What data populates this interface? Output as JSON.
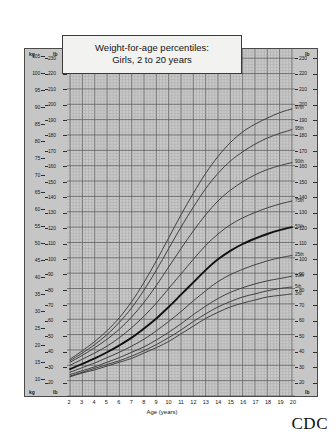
{
  "title": {
    "line1": "Weight-for-age percentiles:",
    "line2": "Girls, 2 to 20 years"
  },
  "branding": {
    "logo_text": "CDC"
  },
  "axes": {
    "x": {
      "label": "Age (years)",
      "ticks": [
        2,
        3,
        4,
        5,
        6,
        7,
        8,
        9,
        10,
        11,
        12,
        13,
        14,
        15,
        16,
        17,
        18,
        19,
        20
      ],
      "min": 1.75,
      "max": 20.25,
      "minor_step": 0.25
    },
    "y_kg": {
      "unit": "kg",
      "ticks": [
        10,
        15,
        20,
        25,
        30,
        35,
        40,
        45,
        50,
        55,
        60,
        65,
        70,
        75,
        80,
        85,
        90,
        95,
        100,
        105
      ],
      "min": 4.5,
      "max": 107.0
    },
    "y_lb_left": {
      "unit": "lb",
      "ticks": [
        10,
        20,
        30,
        40,
        50,
        60,
        70,
        80,
        90,
        100,
        110,
        120,
        130,
        140,
        150,
        160,
        170,
        180,
        190,
        200,
        210,
        220,
        230
      ],
      "min": 10,
      "max": 236
    },
    "y_lb_right": {
      "unit": "lb",
      "ticks": [
        10,
        20,
        30,
        40,
        50,
        60,
        70,
        80,
        90,
        100,
        110,
        120,
        130,
        140,
        150,
        160,
        170,
        180,
        190,
        200,
        210,
        220,
        230
      ]
    }
  },
  "chart_data": {
    "type": "line",
    "title": "Weight-for-age percentiles: Girls, 2 to 20 years",
    "xlabel": "Age (years)",
    "ylabel": "Weight (lb / kg)",
    "xlim": [
      1.75,
      20.25
    ],
    "ylim": [
      10,
      236
    ],
    "ylim_kg": [
      4.5,
      107
    ],
    "grid": true,
    "legend": "right-of-curves",
    "x": [
      2,
      3,
      4,
      5,
      6,
      7,
      8,
      9,
      10,
      11,
      12,
      13,
      14,
      15,
      16,
      17,
      18,
      19,
      20
    ],
    "series": [
      {
        "name": "97th",
        "label": "97th",
        "unit": "lb",
        "bold": false,
        "values": [
          34.0,
          39.5,
          45.5,
          52.5,
          61.0,
          71.5,
          84.0,
          98.0,
          113.0,
          128.0,
          142.0,
          155.0,
          166.0,
          175.0,
          182.0,
          187.0,
          191.0,
          194.5,
          197.0
        ]
      },
      {
        "name": "95th",
        "label": "95th",
        "unit": "lb",
        "bold": false,
        "values": [
          33.0,
          38.0,
          43.5,
          50.0,
          58.0,
          67.5,
          79.0,
          92.0,
          106.0,
          120.0,
          133.0,
          145.0,
          155.0,
          163.0,
          169.0,
          174.0,
          178.0,
          181.0,
          183.5
        ]
      },
      {
        "name": "90th",
        "label": "90th",
        "unit": "lb",
        "bold": false,
        "values": [
          32.0,
          36.5,
          41.5,
          47.0,
          53.5,
          61.5,
          71.0,
          82.0,
          94.0,
          106.0,
          117.5,
          128.0,
          137.0,
          144.0,
          149.5,
          154.0,
          157.5,
          160.0,
          162.0
        ]
      },
      {
        "name": "75th",
        "label": "75th",
        "unit": "lb",
        "bold": false,
        "values": [
          30.0,
          34.0,
          38.0,
          42.5,
          48.0,
          54.5,
          62.0,
          70.5,
          80.0,
          89.5,
          99.0,
          108.0,
          115.5,
          121.5,
          126.0,
          129.5,
          132.5,
          135.0,
          137.0
        ]
      },
      {
        "name": "50th",
        "label": "50th",
        "unit": "lb",
        "bold": true,
        "values": [
          27.5,
          31.0,
          34.5,
          38.5,
          43.0,
          48.0,
          54.0,
          60.5,
          68.0,
          76.0,
          84.0,
          92.0,
          99.0,
          104.5,
          109.0,
          112.5,
          115.5,
          118.0,
          120.0
        ]
      },
      {
        "name": "25th",
        "label": "25th",
        "unit": "lb",
        "bold": false,
        "values": [
          25.5,
          28.5,
          31.5,
          35.0,
          38.5,
          42.5,
          47.0,
          52.5,
          58.5,
          65.0,
          72.0,
          78.5,
          84.5,
          89.0,
          92.5,
          95.5,
          98.0,
          100.0,
          101.5
        ]
      },
      {
        "name": "10th",
        "label": "10th",
        "unit": "lb",
        "bold": false,
        "values": [
          24.0,
          26.5,
          29.0,
          32.0,
          35.0,
          38.5,
          42.0,
          46.5,
          51.5,
          57.0,
          63.0,
          68.5,
          73.5,
          77.5,
          80.5,
          83.0,
          85.0,
          86.5,
          88.0
        ]
      },
      {
        "name": "5th",
        "label": "5th",
        "unit": "lb",
        "bold": false,
        "values": [
          23.0,
          25.5,
          28.0,
          30.5,
          33.0,
          36.0,
          39.5,
          43.5,
          48.0,
          53.0,
          58.5,
          63.5,
          68.0,
          71.5,
          74.5,
          76.5,
          78.5,
          80.0,
          81.0
        ]
      },
      {
        "name": "3rd",
        "label": "3rd",
        "unit": "lb",
        "bold": false,
        "values": [
          22.5,
          25.0,
          27.0,
          29.5,
          32.0,
          34.5,
          38.0,
          41.5,
          45.5,
          50.5,
          55.5,
          60.5,
          64.5,
          68.0,
          70.5,
          72.5,
          74.5,
          75.5,
          76.5
        ]
      }
    ]
  }
}
